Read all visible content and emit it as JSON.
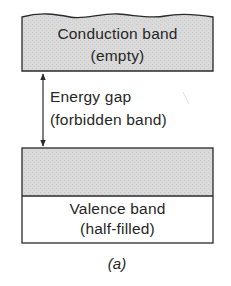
{
  "diagram": {
    "type": "energy-band-diagram",
    "caption": "(a)",
    "colors": {
      "band_fill": "#d9d9d9",
      "line": "#2a2a2a",
      "background": "#ffffff"
    },
    "conduction_band": {
      "label": "Conduction band",
      "sublabel": "(empty)",
      "filled": true
    },
    "energy_gap": {
      "label": "Energy gap",
      "sublabel": "(forbidden band)",
      "arrow": "double-headed vertical"
    },
    "valence_band": {
      "label": "Valence band",
      "sublabel": "(half-filled)",
      "upper_half_filled": true,
      "lower_half_filled": false
    }
  }
}
